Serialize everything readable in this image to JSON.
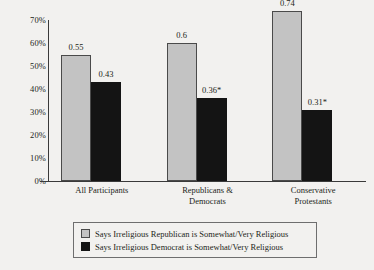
{
  "chart_data": {
    "type": "bar",
    "title": "",
    "subtitle": "",
    "xlabel": "",
    "ylabel": "",
    "ylim": [
      0,
      0.7
    ],
    "ytick_labels": [
      "70%",
      "60%",
      "50%",
      "40%",
      "30%",
      "20%",
      "10%",
      "0%"
    ],
    "ytick_values": [
      0.7,
      0.6,
      0.5,
      0.4,
      0.3,
      0.2,
      0.1,
      0.0
    ],
    "grid": false,
    "legend_position": "bottom",
    "categories": [
      "All Participants",
      "Republicans &\nDemocrats",
      "Conservative\nProtestants"
    ],
    "category_lines": [
      [
        "All Participants"
      ],
      [
        "Republicans &",
        "Democrats"
      ],
      [
        "Conservative",
        "Protestants"
      ]
    ],
    "series": [
      {
        "name": "Says Irreligious Republican is Somewhat/Very Religious",
        "color": "#c3c3c3",
        "values": [
          0.55,
          0.6,
          0.74
        ],
        "labels": [
          "0.55",
          "0.6",
          "0.74"
        ]
      },
      {
        "name": "Says Irreligious Democrat is Somewhat/Very Religious",
        "color": "#141414",
        "values": [
          0.43,
          0.36,
          0.31
        ],
        "labels": [
          "0.43",
          "0.36*",
          "0.31*"
        ]
      }
    ],
    "annotations": [
      "* denotes statistically significant difference"
    ]
  },
  "colors": {
    "background": "#f2f1ef",
    "axis": "#3a3a3a",
    "text": "#231f20",
    "series_light": "#c3c3c3",
    "series_dark": "#141414",
    "legend_border": "#6e6e6e"
  }
}
